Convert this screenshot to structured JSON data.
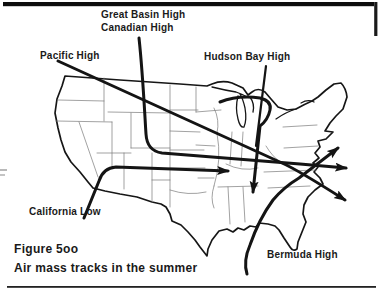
{
  "figure": {
    "number": "Figure 5oo",
    "caption": "Air mass tracks in the summer"
  },
  "map_labels": {
    "great_basin": "Great Basin High",
    "canadian": "Canadian High",
    "pacific": "Pacific High",
    "hudson_bay": "Hudson Bay High",
    "california": "California Low",
    "bermuda": "Bermuda High"
  },
  "tracks": [
    {
      "label": "Pacific High",
      "arrow_direction": "southeast across the country, exiting the Atlantic coast"
    },
    {
      "label": "Great Basin High / Canadian High",
      "arrow_direction": "south then east, exiting the Atlantic coast"
    },
    {
      "label": "California Low",
      "arrow_direction": "northeast then east into the Midwest"
    },
    {
      "label": "Hudson Bay High",
      "arrow_direction": "south into the Tennessee valley"
    },
    {
      "label": "Bermuda High",
      "arrow_direction": "from the Gulf coast curving northeast offshore"
    }
  ],
  "colors": {
    "ink": "#141414",
    "state_line": "#7a7a7a",
    "background": "#ffffff"
  }
}
